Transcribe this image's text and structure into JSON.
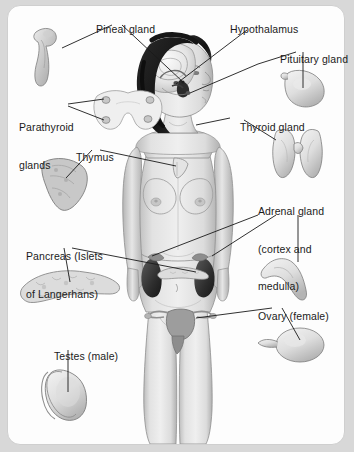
{
  "figure": {
    "background_color": "#d8d8d8",
    "card_color": "#fdfdfd",
    "card_border_color": "#cfcfcf",
    "text_color": "#1b1b1b",
    "leader_line_color": "#1a1a1a"
  },
  "labels": [
    {
      "id": "pineal",
      "text": "Pineal gland",
      "x": 84,
      "y": 10,
      "lines": [
        "Pineal gland"
      ]
    },
    {
      "id": "hypothalamus",
      "text": "Hypothalamus",
      "x": 218,
      "y": 10,
      "lines": [
        "Hypothalamus"
      ]
    },
    {
      "id": "pituitary",
      "text": "Pituitary gland",
      "x": 268,
      "y": 40,
      "lines": [
        "Pituitary gland"
      ]
    },
    {
      "id": "parathyroid",
      "text": "Parathyroid glands",
      "x": 19,
      "y": 96,
      "lines": [
        "Parathyroid",
        "glands"
      ]
    },
    {
      "id": "thyroid",
      "text": "Thyroid gland",
      "x": 228,
      "y": 108,
      "lines": [
        "Thyroid gland"
      ]
    },
    {
      "id": "thymus",
      "text": "Thymus",
      "x": 64,
      "y": 138,
      "lines": [
        "Thymus"
      ]
    },
    {
      "id": "adrenal",
      "text": "Adrenal gland (cortex and medulla)",
      "x": 258,
      "y": 180,
      "lines": [
        "Adrenal gland",
        "(cortex and",
        "medulla)"
      ]
    },
    {
      "id": "pancreas",
      "text": "Pancreas (Islets of Langerhans)",
      "x": 26,
      "y": 225,
      "lines": [
        "Pancreas (Islets",
        "of Langerhans)"
      ]
    },
    {
      "id": "ovary",
      "text": "Ovary (female)",
      "x": 246,
      "y": 297,
      "lines": [
        "Ovary (female)"
      ]
    },
    {
      "id": "testes",
      "text": "Testes (male)",
      "x": 42,
      "y": 337,
      "lines": [
        "Testes (male)"
      ]
    }
  ],
  "glands": [
    {
      "id": "pineal-inset",
      "name": "Pineal gland illustration"
    },
    {
      "id": "pituitary-inset",
      "name": "Pituitary gland illustration"
    },
    {
      "id": "parathyroid-inset",
      "name": "Parathyroid glands illustration"
    },
    {
      "id": "thyroid-inset",
      "name": "Thyroid gland illustration"
    },
    {
      "id": "thymus-inset",
      "name": "Thymus illustration"
    },
    {
      "id": "adrenal-inset",
      "name": "Adrenal gland illustration"
    },
    {
      "id": "pancreas-inset",
      "name": "Pancreas illustration"
    },
    {
      "id": "ovary-inset",
      "name": "Ovary illustration"
    },
    {
      "id": "testes-inset",
      "name": "Testes illustration"
    },
    {
      "id": "body-figure",
      "name": "Female body figure with head cutaway"
    }
  ]
}
